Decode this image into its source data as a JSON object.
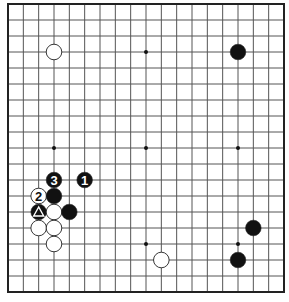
{
  "diagram": {
    "type": "go-board",
    "size": 19,
    "background": "#ffffff",
    "line_color": "#555555",
    "border_color": "#222222",
    "black_stone_color": "#111111",
    "white_stone_color": "#ffffff",
    "star_points": [
      [
        3,
        3
      ],
      [
        9,
        3
      ],
      [
        15,
        3
      ],
      [
        3,
        9
      ],
      [
        9,
        9
      ],
      [
        15,
        9
      ],
      [
        3,
        15
      ],
      [
        9,
        15
      ],
      [
        15,
        15
      ]
    ],
    "stones": [
      {
        "color": "white",
        "col": 3,
        "row": 3,
        "label": ""
      },
      {
        "color": "black",
        "col": 15,
        "row": 3,
        "label": ""
      },
      {
        "color": "black",
        "col": 5,
        "row": 11,
        "label": "1"
      },
      {
        "color": "white",
        "col": 2,
        "row": 12,
        "label": "2"
      },
      {
        "color": "black",
        "col": 3,
        "row": 11,
        "label": "3"
      },
      {
        "color": "black",
        "col": 3,
        "row": 12,
        "label": ""
      },
      {
        "color": "black",
        "col": 2,
        "row": 13,
        "label": "",
        "marker": "triangle"
      },
      {
        "color": "white",
        "col": 3,
        "row": 13,
        "label": ""
      },
      {
        "color": "black",
        "col": 4,
        "row": 13,
        "label": ""
      },
      {
        "color": "white",
        "col": 2,
        "row": 14,
        "label": ""
      },
      {
        "color": "white",
        "col": 3,
        "row": 14,
        "label": ""
      },
      {
        "color": "white",
        "col": 3,
        "row": 15,
        "label": ""
      },
      {
        "color": "white",
        "col": 10,
        "row": 16,
        "label": ""
      },
      {
        "color": "black",
        "col": 16,
        "row": 14,
        "label": ""
      },
      {
        "color": "black",
        "col": 15,
        "row": 16,
        "label": ""
      }
    ]
  }
}
